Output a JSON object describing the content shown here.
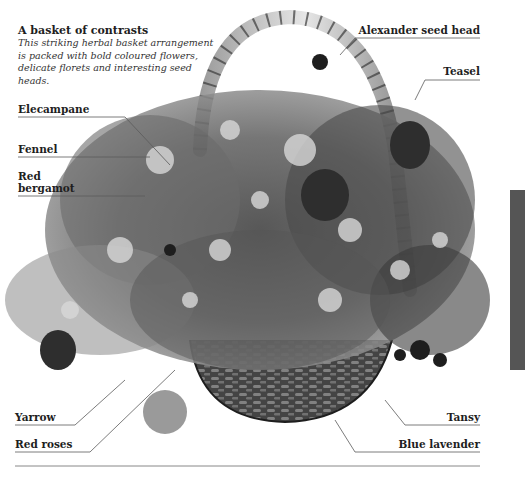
{
  "caption": {
    "title": "A basket of contrasts",
    "body": "This striking herbal basket arrangement is packed with bold coloured flowers, delicate florets and interesting seed heads."
  },
  "labels": {
    "left": [
      {
        "id": "elecampane",
        "text": "Elecampane"
      },
      {
        "id": "fennel",
        "text": "Fennel"
      },
      {
        "id": "red-bergamot-1",
        "text": "Red"
      },
      {
        "id": "red-bergamot-2",
        "text": "bergamot"
      },
      {
        "id": "yarrow",
        "text": "Yarrow"
      },
      {
        "id": "red-roses",
        "text": "Red roses"
      }
    ],
    "right": [
      {
        "id": "alexander-seed-head",
        "text": "Alexander seed head"
      },
      {
        "id": "teasel",
        "text": "Teasel"
      },
      {
        "id": "tansy",
        "text": "Tansy"
      },
      {
        "id": "blue-lavender",
        "text": "Blue lavender"
      }
    ]
  },
  "image": {
    "subject": "herbal-basket-arrangement",
    "palette": {
      "background": "#ffffff",
      "dark": "#2a2a2a",
      "mid": "#7a7a7a",
      "light": "#c8c8c8",
      "rule": "#6a6a6a"
    }
  }
}
